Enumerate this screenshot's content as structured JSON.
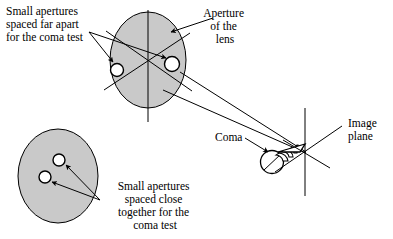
{
  "figure": {
    "background_color": "#ffffff",
    "ellipse_fill_color": "#c9c9c9",
    "line_color": "#000000"
  },
  "labels": {
    "far_apart": {
      "name": "small-apertures-far-apart-label",
      "lines": [
        "Small apertures",
        "spaced far apart",
        "for the coma test"
      ],
      "align": "left"
    },
    "aperture_of_lens": {
      "name": "aperture-of-the-lens-label",
      "lines": [
        "Aperture",
        "of the",
        "lens"
      ],
      "align": "center"
    },
    "coma": {
      "name": "coma-label",
      "lines": [
        "Coma"
      ],
      "align": "left"
    },
    "image_plane": {
      "name": "image-plane-label",
      "lines": [
        "Image",
        "plane"
      ],
      "align": "left"
    },
    "close_together": {
      "name": "small-apertures-close-together-label",
      "lines": [
        "Small apertures",
        "spaced close",
        "together for the",
        "coma test"
      ],
      "align": "center"
    }
  },
  "shapes": {
    "upper_lens": {
      "name": "upper-lens-aperture-ellipse",
      "cx": 148,
      "cy": 60,
      "rx": 38,
      "ry": 48,
      "apertures": [
        {
          "name": "aperture-hole-left",
          "cx": 117,
          "cy": 70,
          "r": 6.5
        },
        {
          "name": "aperture-hole-right",
          "cx": 172,
          "cy": 64,
          "r": 7.5
        }
      ]
    },
    "lower_lens": {
      "name": "lower-lens-aperture-ellipse",
      "cx": 58,
      "cy": 176,
      "rx": 40,
      "ry": 47,
      "apertures": [
        {
          "name": "aperture-hole-upper",
          "cx": 59,
          "cy": 160,
          "r": 6.0
        },
        {
          "name": "aperture-hole-lower",
          "cx": 45,
          "cy": 177,
          "r": 6.0
        }
      ]
    },
    "coma_flare": {
      "name": "coma-flare-shape",
      "circle": {
        "cx": 272,
        "cy": 162,
        "r": 11.5
      },
      "vertex": {
        "x": 305,
        "y": 144
      },
      "arc_count": 4
    },
    "image_plane": {
      "name": "image-plane-axes",
      "vertex": {
        "x": 305,
        "y": 152
      },
      "vertical": {
        "x": 305,
        "y1": 110,
        "y2": 195
      },
      "diagonals": 2
    }
  }
}
